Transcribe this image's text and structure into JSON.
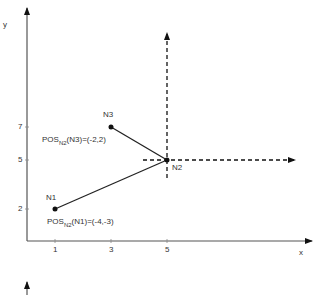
{
  "diagram": {
    "axes": {
      "x_label": "x",
      "y_label": "y",
      "x_ticks": [
        "1",
        "3",
        "5"
      ],
      "y_ticks": [
        "7",
        "5",
        "2"
      ]
    },
    "nodes": [
      {
        "id": "N1",
        "label": "N1",
        "x": 1,
        "y": 2
      },
      {
        "id": "N2",
        "label": "N2",
        "x": 5,
        "y": 5
      },
      {
        "id": "N3",
        "label": "N3",
        "x": 3,
        "y": 7
      }
    ],
    "annotations": {
      "n3_pos": {
        "prefix": "POS",
        "sub": "N2",
        "suffix": "(N3)=(-2,2)"
      },
      "n1_pos": {
        "prefix": "POS",
        "sub": "N2",
        "suffix": "(N1)=(-4,-3)"
      }
    },
    "edges": [
      {
        "from": "N1",
        "to": "N2",
        "style": "solid"
      },
      {
        "from": "N3",
        "to": "N2",
        "style": "solid"
      }
    ],
    "local_axes": {
      "origin": "N2",
      "style": "dashed"
    },
    "colors": {
      "line": "#222222",
      "axis": "#555555"
    }
  }
}
